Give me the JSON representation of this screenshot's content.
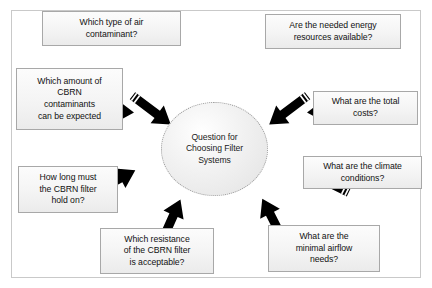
{
  "diagram": {
    "title": "Question for Choosing Filter Systems",
    "center": {
      "label": "Question for\nChoosing Filter\nSystems",
      "shape": "ellipse",
      "fill": "#eeeeee",
      "border_color": "#9a9a9a",
      "border_style": "dotted"
    },
    "style": {
      "box_fill": "#f4f4f4",
      "box_border": "#a8a8a8",
      "arrow_color": "#000000",
      "canvas_background": "#ffffff",
      "frame_border": "#c9c9c9",
      "text_color": "#111111"
    },
    "nodes": [
      {
        "id": "air-contaminant",
        "label": "Which type of air\ncontaminant?",
        "position": "top-left"
      },
      {
        "id": "energy-resources",
        "label": "Are the needed energy\nresources available?",
        "position": "top-right"
      },
      {
        "id": "cbrn-amount",
        "label": "Which amount of\nCBRN\ncontaminants\ncan be expected",
        "position": "left-upper"
      },
      {
        "id": "total-costs",
        "label": "What are the total\ncosts?",
        "position": "right-upper"
      },
      {
        "id": "filter-hold-on",
        "label": "How long must\nthe CBRN filter\nhold on?",
        "position": "left-lower"
      },
      {
        "id": "climate-conditions",
        "label": "What are the climate\nconditions?",
        "position": "right-lower"
      },
      {
        "id": "filter-resistance",
        "label": "Which resistance\nof the CBRN filter\nis acceptable?",
        "position": "bottom-left"
      },
      {
        "id": "minimal-airflow",
        "label": "What are the\nminimal airflow\nneeds?",
        "position": "bottom-right"
      }
    ],
    "arrows": [
      {
        "id": "arrow-to-air-contaminant",
        "direction": "up-left",
        "target": "air-contaminant"
      },
      {
        "id": "arrow-to-energy-resources",
        "direction": "up-right",
        "target": "energy-resources"
      },
      {
        "id": "arrow-to-cbrn-amount",
        "direction": "left",
        "target": "cbrn-amount"
      },
      {
        "id": "arrow-to-total-costs",
        "direction": "right",
        "target": "total-costs"
      },
      {
        "id": "arrow-to-filter-hold-on",
        "direction": "down-left",
        "target": "filter-hold-on"
      },
      {
        "id": "arrow-to-climate-conditions",
        "direction": "down-right",
        "target": "climate-conditions"
      },
      {
        "id": "arrow-to-filter-resistance",
        "direction": "down",
        "target": "filter-resistance"
      },
      {
        "id": "arrow-to-minimal-airflow",
        "direction": "down-right-steep",
        "target": "minimal-airflow"
      }
    ]
  }
}
